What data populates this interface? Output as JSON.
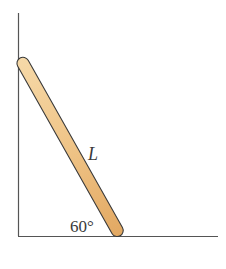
{
  "diagram": {
    "labels": {
      "length": "L",
      "angle": "60°"
    },
    "colors": {
      "ladder_fill": "#efc487",
      "ladder_edge": "#3a3a3a",
      "wall": "#555555"
    }
  }
}
